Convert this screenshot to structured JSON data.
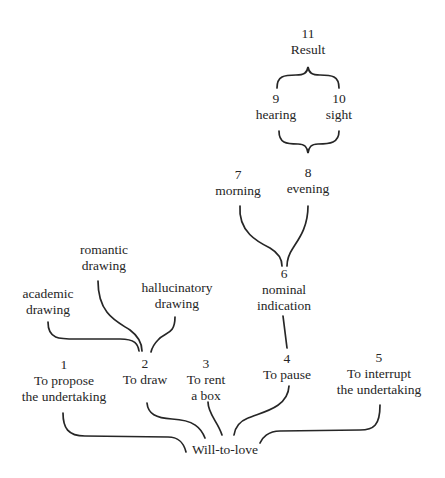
{
  "diagram": {
    "root": "Will-to-love",
    "nodes": [
      {
        "id": "1",
        "number": "1",
        "label_lines": [
          "To propose",
          "the undertaking"
        ],
        "connects_to": "Will-to-love"
      },
      {
        "id": "2",
        "number": "2",
        "label_lines": [
          "To draw"
        ],
        "connects_to": "Will-to-love"
      },
      {
        "id": "3",
        "number": "3",
        "label_lines": [
          "To rent",
          "a box"
        ],
        "connects_to": "Will-to-love"
      },
      {
        "id": "4",
        "number": "4",
        "label_lines": [
          "To pause"
        ],
        "connects_to": "Will-to-love"
      },
      {
        "id": "5",
        "number": "5",
        "label_lines": [
          "To interrupt",
          "the undertaking"
        ],
        "connects_to": "Will-to-love"
      },
      {
        "id": "6",
        "number": "6",
        "label_lines": [
          "nominal",
          "indication"
        ],
        "connects_to": "4"
      },
      {
        "id": "7",
        "number": "7",
        "label_lines": [
          "morning"
        ],
        "connects_to": "6"
      },
      {
        "id": "8",
        "number": "8",
        "label_lines": [
          "evening"
        ],
        "connects_to": "6"
      },
      {
        "id": "9",
        "number": "9",
        "label_lines": [
          "hearing"
        ],
        "connects_to": "11"
      },
      {
        "id": "10",
        "number": "10",
        "label_lines": [
          "sight"
        ],
        "connects_to": "11"
      },
      {
        "id": "11",
        "number": "11",
        "label_lines": [
          "Result"
        ],
        "connects_to": null
      }
    ],
    "sub_branches": [
      {
        "label_lines": [
          "academic",
          "drawing"
        ],
        "connects_to": "2"
      },
      {
        "label_lines": [
          "romantic",
          "drawing"
        ],
        "connects_to": "2"
      },
      {
        "label_lines": [
          "hallucinatory",
          "drawing"
        ],
        "connects_to": "2"
      }
    ],
    "notes": {
      "braces": "9 and 10 are joined by a brace above into 11 (Result) and by a brace below converging toward 8 (evening)"
    }
  }
}
